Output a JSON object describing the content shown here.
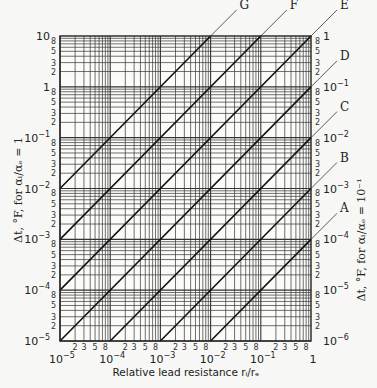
{
  "chart_data": {
    "type": "line",
    "title": "",
    "xlabel": "Relative lead resistance r_l/r_e",
    "ylabel_left": "Δt, °F, for α_l/α_e = 1",
    "ylabel_right": "Δt, °F, for α_l/α_e = 10^-1",
    "xscale": "log",
    "yscale": "log",
    "xlim": [
      1e-05,
      1
    ],
    "ylim_left": [
      1e-05,
      10
    ],
    "ylim_right": [
      1e-06,
      1
    ],
    "grid": true,
    "x_decade_labels": [
      "10^-5",
      "10^-4",
      "10^-3",
      "10^-2",
      "10^-1",
      "1"
    ],
    "y_left_decade_labels": [
      "10^-5",
      "10^-4",
      "10^-3",
      "10^-2",
      "10^-1",
      "1",
      "10"
    ],
    "y_right_decade_labels": [
      "10^-6",
      "10^-5",
      "10^-4",
      "10^-3",
      "10^-2",
      "10^-1",
      "1"
    ],
    "minor_tick_labels": [
      "2",
      "3",
      "5",
      "8"
    ],
    "series": [
      {
        "name": "A",
        "slope": 1,
        "coef_left": 0.001,
        "x": [
          0.01,
          1
        ],
        "y_left": [
          1e-05,
          0.001
        ]
      },
      {
        "name": "B",
        "slope": 1,
        "coef_left": 0.01,
        "x": [
          0.001,
          1
        ],
        "y_left": [
          1e-05,
          0.01
        ]
      },
      {
        "name": "C",
        "slope": 1,
        "coef_left": 0.1,
        "x": [
          0.0001,
          1
        ],
        "y_left": [
          1e-05,
          0.1
        ]
      },
      {
        "name": "D",
        "slope": 1,
        "coef_left": 1,
        "x": [
          1e-05,
          1
        ],
        "y_left": [
          1e-05,
          1
        ]
      },
      {
        "name": "E",
        "slope": 1,
        "coef_left": 10,
        "x": [
          1e-05,
          1
        ],
        "y_left": [
          0.0001,
          10
        ]
      },
      {
        "name": "F",
        "slope": 1,
        "coef_left": 100,
        "x": [
          1e-05,
          0.1
        ],
        "y_left": [
          0.001,
          10
        ]
      },
      {
        "name": "G",
        "slope": 1,
        "coef_left": 1000,
        "x": [
          1e-05,
          0.01
        ],
        "y_left": [
          0.01,
          10
        ]
      }
    ]
  }
}
